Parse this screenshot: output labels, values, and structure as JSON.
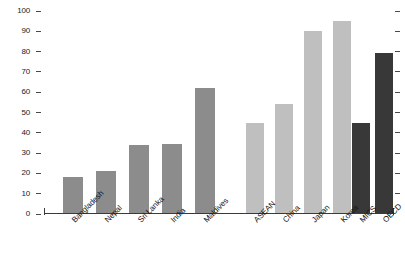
{
  "chart_data": {
    "type": "bar",
    "title": "",
    "subtitle": "",
    "xlabel": "",
    "ylabel": "",
    "ylim": [
      0,
      100
    ],
    "yticks": [
      0,
      10,
      20,
      30,
      40,
      50,
      60,
      70,
      80,
      90,
      100
    ],
    "ytick_labels": [
      "0",
      "10",
      "20",
      "30",
      "40",
      "50",
      "60",
      "70",
      "80",
      "90",
      "100"
    ],
    "grid": false,
    "legend": "none",
    "right_axis_ticks": true,
    "right_axis_labels": false,
    "categories": [
      "Bangladesh",
      "Nepal",
      "Sri Lanka",
      "India",
      "Maldives",
      "ASEAN",
      "China",
      "Japan",
      "Korea",
      "MICS",
      "OECD"
    ],
    "values": [
      18,
      21,
      34,
      34.5,
      62,
      45,
      54,
      90,
      95,
      45,
      79.5
    ],
    "bar_colors": [
      "#8c8c8c",
      "#8c8c8c",
      "#8c8c8c",
      "#8c8c8c",
      "#8c8c8c",
      "#bfbfbf",
      "#bfbfbf",
      "#bfbfbf",
      "#bfbfbf",
      "#383838",
      "#383838"
    ],
    "groups": [
      {
        "name": "South Asia",
        "categories": [
          "Bangladesh",
          "Nepal",
          "Sri Lanka",
          "India",
          "Maldives"
        ],
        "color": "#8c8c8c"
      },
      {
        "name": "East and Southeast Asia",
        "categories": [
          "ASEAN",
          "China",
          "Japan",
          "Korea"
        ],
        "color": "#bfbfbf"
      },
      {
        "name": "Benchmarks",
        "categories": [
          "MICS",
          "OECD"
        ],
        "color": "#383838"
      }
    ],
    "series": [
      {
        "name": "Value",
        "points": [
          {
            "category": "Bangladesh",
            "value": 18
          },
          {
            "category": "Nepal",
            "value": 21
          },
          {
            "category": "Sri Lanka",
            "value": 34
          },
          {
            "category": "India",
            "value": 34.5
          },
          {
            "category": "Maldives",
            "value": 62
          },
          {
            "category": "ASEAN",
            "value": 45
          },
          {
            "category": "China",
            "value": 54
          },
          {
            "category": "Japan",
            "value": 90
          },
          {
            "category": "Korea",
            "value": 95
          },
          {
            "category": "MICS",
            "value": 45
          },
          {
            "category": "OECD",
            "value": 79.5
          }
        ]
      }
    ]
  },
  "layout": {
    "bar_x": [
      63,
      96,
      129,
      162,
      195,
      246,
      275,
      304,
      333,
      352,
      375
    ],
    "bar_width": [
      20,
      20,
      20,
      20,
      20,
      18,
      18,
      18,
      18,
      18,
      18
    ]
  }
}
